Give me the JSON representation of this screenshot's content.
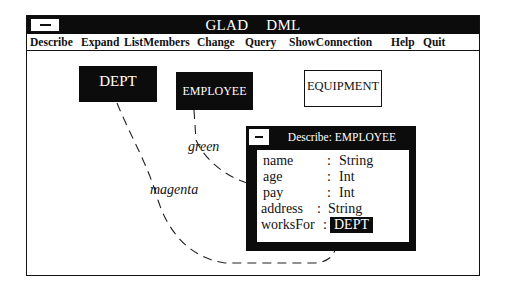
{
  "window": {
    "title": "GLAD    DML",
    "system_menu_icon": "minus-icon"
  },
  "menu": {
    "items": [
      {
        "label": "Describe"
      },
      {
        "label": "Expand"
      },
      {
        "label": "ListMembers"
      },
      {
        "label": "Change"
      },
      {
        "label": "Query"
      },
      {
        "label": "ShowConnection"
      },
      {
        "label": "Help"
      },
      {
        "label": "Quit"
      }
    ]
  },
  "canvas": {
    "entities": [
      {
        "label": "DEPT",
        "style": "filled"
      },
      {
        "label": "EMPLOYEE",
        "style": "filled"
      },
      {
        "label": "EQUIPMENT",
        "style": "outline"
      }
    ],
    "connections": [
      {
        "label": "green",
        "from": "EMPLOYEE",
        "to": "Describe: EMPLOYEE"
      },
      {
        "label": "magenta",
        "from": "DEPT",
        "to": "Describe: EMPLOYEE"
      }
    ]
  },
  "describe_dialog": {
    "title": "Describe: EMPLOYEE",
    "system_menu_icon": "minus-icon",
    "attributes": [
      {
        "name": "name",
        "separator": ":",
        "type": "String"
      },
      {
        "name": "age",
        "separator": ":",
        "type": "Int"
      },
      {
        "name": "pay",
        "separator": ":",
        "type": "Int"
      },
      {
        "name": "address",
        "separator": ":",
        "type": "String"
      },
      {
        "name": "worksFor",
        "separator": ":",
        "type": "DEPT"
      }
    ]
  }
}
